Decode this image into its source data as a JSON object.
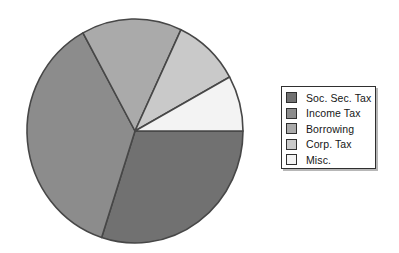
{
  "chart_data": {
    "type": "pie",
    "labels": [
      "Soc. Sec. Tax",
      "Income Tax",
      "Borrowing",
      "Corp. Tax",
      "Misc."
    ],
    "values": [
      30,
      37,
      15,
      10,
      8
    ],
    "colors": [
      "#717171",
      "#8c8c8c",
      "#aaaaaa",
      "#c9c9c9",
      "#f3f3f3"
    ],
    "outline_color": "#474747",
    "start_angle_deg": 0,
    "direction": "clockwise",
    "legend_position": "right",
    "grid": false,
    "data_labels_shown": false
  }
}
